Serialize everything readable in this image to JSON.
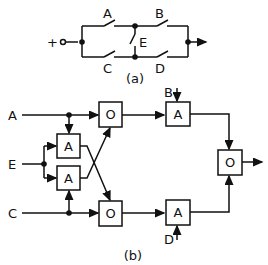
{
  "figure_a": {
    "caption": "(a)",
    "source_symbol": "+",
    "switches": {
      "top_left": "A",
      "top_right": "B",
      "middle": "E",
      "bottom_left": "C",
      "bottom_right": "D"
    }
  },
  "figure_b": {
    "caption": "(b)",
    "inputs": {
      "a": "A",
      "e": "E",
      "c": "C",
      "b": "B",
      "d": "D"
    },
    "gates": {
      "and_upper_left": "A",
      "and_lower_left": "A",
      "or_top": "O",
      "or_bottom": "O",
      "and_top_right": "A",
      "and_bottom_right": "A",
      "or_output": "O"
    }
  },
  "colors": {
    "line": "#111111",
    "background": "#ffffff"
  }
}
